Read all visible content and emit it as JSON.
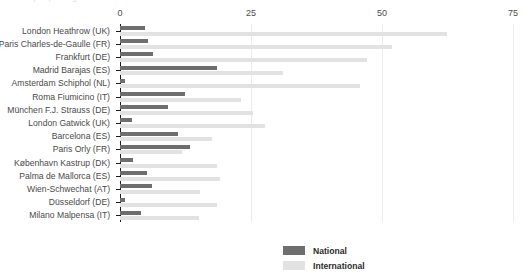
{
  "chart_data": {
    "type": "bar",
    "orientation": "horizontal",
    "title": "Air transport passengers",
    "xlabel": "",
    "ylabel": "",
    "xlim": [
      0,
      75
    ],
    "xticks": [
      0,
      25,
      50,
      75
    ],
    "grid": true,
    "legend_position": "bottom-center",
    "categories": [
      "London Heathrow (UK)",
      "Paris Charles-de-Gaulle (FR)",
      "Frankfurt (DE)",
      "Madrid Barajas (ES)",
      "Amsterdam Schiphol (NL)",
      "Roma Fiumicino (IT)",
      "München F.J. Strauss (DE)",
      "London Gatwick (UK)",
      "Barcelona (ES)",
      "Paris Orly (FR)",
      "København Kastrup (DK)",
      "Palma de Mallorca (ES)",
      "Wien-Schwechat (AT)",
      "Düsseldorf (DE)",
      "Milano Malpensa (IT)"
    ],
    "series": [
      {
        "name": "National",
        "color": "#6e6e6e",
        "values": [
          4.8,
          5.4,
          6.3,
          18.5,
          1.0,
          12.4,
          9.2,
          2.3,
          11.1,
          13.4,
          2.5,
          5.2,
          6.1,
          1.0,
          4.0
        ]
      },
      {
        "name": "International",
        "color": "#e2e2e2",
        "values": [
          62.4,
          52.0,
          47.1,
          31.1,
          45.8,
          23.0,
          25.4,
          27.7,
          17.6,
          11.8,
          18.5,
          19.1,
          15.3,
          18.5,
          15.0
        ]
      }
    ]
  },
  "legend": {
    "items": [
      {
        "label": "National",
        "color": "#6e6e6e"
      },
      {
        "label": "International",
        "color": "#e2e2e2"
      }
    ]
  }
}
